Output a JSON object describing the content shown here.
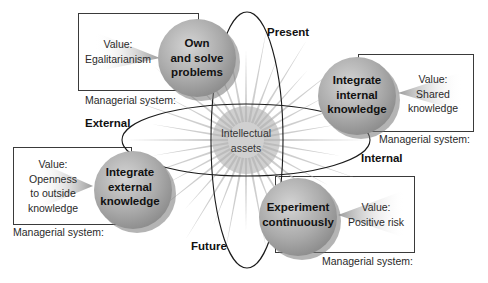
{
  "diagram": {
    "center": {
      "line1": "Intellectual",
      "line2": "assets"
    },
    "axes": {
      "present": "Present",
      "future": "Future",
      "external": "External",
      "internal": "Internal"
    },
    "nodes": [
      {
        "id": "own",
        "lines": [
          "Own",
          "and solve",
          "problems"
        ],
        "value_label": "Value:",
        "value_lines": [
          "Egalitarianism"
        ],
        "managerial": "Managerial system:"
      },
      {
        "id": "internal",
        "lines": [
          "Integrate",
          "internal",
          "knowledge"
        ],
        "value_label": "Value:",
        "value_lines": [
          "Shared",
          "knowledge"
        ],
        "managerial": "Managerial system:"
      },
      {
        "id": "external",
        "lines": [
          "Integrate",
          "external",
          "knowledge"
        ],
        "value_label": "Value:",
        "value_lines": [
          "Openness",
          "to outside",
          "knowledge"
        ],
        "managerial": "Managerial system:"
      },
      {
        "id": "experiment",
        "lines": [
          "Experiment",
          "continuously"
        ],
        "value_label": "Value:",
        "value_lines": [
          "Positive risk"
        ],
        "managerial": "Managerial system:"
      }
    ],
    "colors": {
      "sphere_light": "#cfcfcf",
      "sphere_mid": "#a9a9a9",
      "sphere_dark": "#7a7a7a",
      "ray": "#b8b8b8",
      "line": "#1a1a1a",
      "box": "#3a3a3a"
    }
  }
}
